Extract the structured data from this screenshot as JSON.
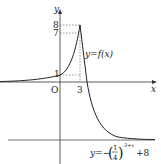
{
  "diagram": {
    "axes": {
      "x_label": "x",
      "y_label": "y",
      "origin_label": "O"
    },
    "ticks": {
      "y": [
        "8",
        "7",
        "1"
      ],
      "x": [
        "3"
      ]
    },
    "curve_labels": {
      "upper": "y=f(x)",
      "lower_prefix": "y=−",
      "lower_frac_num": "1",
      "lower_frac_den": "4",
      "lower_exponent": "3+x",
      "lower_suffix": "+8"
    },
    "colors": {
      "curve": "#222222",
      "axis": "#333333",
      "dashed": "#555555"
    }
  }
}
